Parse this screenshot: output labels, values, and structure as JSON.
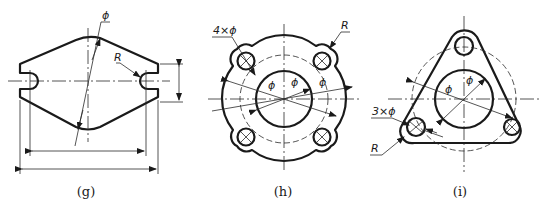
{
  "figures": [
    {
      "id": "g",
      "caption": "(g)",
      "labels": {
        "diameter": "ϕ",
        "radius": "R"
      }
    },
    {
      "id": "h",
      "caption": "(h)",
      "labels": {
        "holes": "4×ϕ",
        "radius": "R",
        "dia_inner": "ϕ",
        "dia_mid": "ϕ",
        "dia_outer": "ϕ"
      }
    },
    {
      "id": "i",
      "caption": "(i)",
      "labels": {
        "holes": "3×ϕ",
        "radius": "R",
        "dia_inner": "ϕ",
        "dia_mid": "ϕ"
      }
    }
  ]
}
